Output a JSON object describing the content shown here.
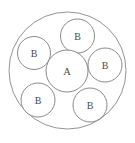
{
  "figure": {
    "type": "circle-packing-diagram",
    "background_color": "#ffffff",
    "stroke_color": "#8a8a8a",
    "label_color": "#4a4a4a",
    "canvas": {
      "width": 135,
      "height": 143
    }
  },
  "outer_circle": {
    "label": "",
    "cx": 67.5,
    "cy": 70.5,
    "r": 58.5,
    "stroke": "#949494",
    "fill": "#ffffff"
  },
  "center_circle": {
    "label": "A",
    "cx": 67,
    "cy": 71,
    "r": 21,
    "stroke": "#8a8a8a",
    "fill": "#ffffff"
  },
  "satellite_circles": [
    {
      "label": "B",
      "cx": 77.5,
      "cy": 36.0,
      "r": 17.0,
      "position": "top"
    },
    {
      "label": "B",
      "cx": 34.0,
      "cy": 53.0,
      "r": 16.5,
      "position": "upper-left"
    },
    {
      "label": "B",
      "cx": 105.0,
      "cy": 65.0,
      "r": 17.0,
      "position": "right"
    },
    {
      "label": "B",
      "cx": 38.0,
      "cy": 100.0,
      "r": 17.0,
      "position": "lower-left"
    },
    {
      "label": "B",
      "cx": 90.0,
      "cy": 105.0,
      "r": 17.0,
      "position": "lower-right"
    }
  ],
  "counts": {
    "outer_circles": 1,
    "center_circles": 1,
    "satellite_circles": 5,
    "total_circles": 7
  }
}
